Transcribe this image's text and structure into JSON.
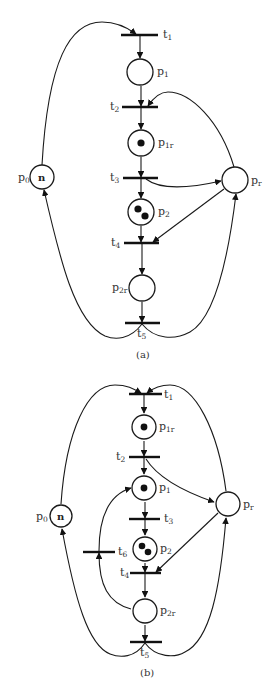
{
  "figure": {
    "type": "petri-net-pair",
    "colors": {
      "stroke": "#1a1a1a",
      "token": "#111111",
      "background": "#ffffff"
    }
  },
  "diagram_a": {
    "caption": "(a)",
    "places": {
      "p0": {
        "base": "p",
        "sub": "0",
        "marking": "n"
      },
      "p1": {
        "base": "p",
        "sub": "1",
        "tokens": 0
      },
      "p1r": {
        "base": "p",
        "sub": "1r",
        "tokens": 1
      },
      "p2": {
        "base": "p",
        "sub": "2",
        "tokens": 2
      },
      "p2r": {
        "base": "p",
        "sub": "2r",
        "tokens": 0
      },
      "pr": {
        "base": "p",
        "sub": "r",
        "tokens": 0
      }
    },
    "transitions": {
      "t1": {
        "base": "t",
        "sub": "1"
      },
      "t2": {
        "base": "t",
        "sub": "2"
      },
      "t3": {
        "base": "t",
        "sub": "3"
      },
      "t4": {
        "base": "t",
        "sub": "4"
      },
      "t5": {
        "base": "t",
        "sub": "5"
      }
    },
    "arcs": [
      [
        "p0",
        "t1"
      ],
      [
        "t1",
        "p1"
      ],
      [
        "p1",
        "t2"
      ],
      [
        "pr",
        "t2"
      ],
      [
        "t2",
        "p1r"
      ],
      [
        "p1r",
        "t3"
      ],
      [
        "t3",
        "p2"
      ],
      [
        "t3",
        "pr"
      ],
      [
        "p2",
        "t4"
      ],
      [
        "pr",
        "t4"
      ],
      [
        "t4",
        "p2r"
      ],
      [
        "p2r",
        "t5"
      ],
      [
        "t5",
        "p0"
      ],
      [
        "t5",
        "pr"
      ]
    ]
  },
  "diagram_b": {
    "caption": "(b)",
    "places": {
      "p0": {
        "base": "p",
        "sub": "0",
        "marking": "n"
      },
      "p1r": {
        "base": "p",
        "sub": "1r",
        "tokens": 1
      },
      "p1": {
        "base": "p",
        "sub": "1",
        "tokens": 1
      },
      "p2": {
        "base": "p",
        "sub": "2",
        "tokens": 2
      },
      "p2r": {
        "base": "p",
        "sub": "2r",
        "tokens": 0
      },
      "pr": {
        "base": "p",
        "sub": "r",
        "tokens": 0
      }
    },
    "transitions": {
      "t1": {
        "base": "t",
        "sub": "1"
      },
      "t2": {
        "base": "t",
        "sub": "2"
      },
      "t3": {
        "base": "t",
        "sub": "3"
      },
      "t4": {
        "base": "t",
        "sub": "4"
      },
      "t5": {
        "base": "t",
        "sub": "5"
      },
      "t6": {
        "base": "t",
        "sub": "6"
      }
    },
    "arcs": [
      [
        "p0",
        "t1"
      ],
      [
        "pr",
        "t1"
      ],
      [
        "t1",
        "p1r"
      ],
      [
        "p1r",
        "t2"
      ],
      [
        "t2",
        "p1"
      ],
      [
        "t2",
        "pr"
      ],
      [
        "p1",
        "t3"
      ],
      [
        "t3",
        "p2"
      ],
      [
        "p2",
        "t4"
      ],
      [
        "pr",
        "t4"
      ],
      [
        "t4",
        "p2r"
      ],
      [
        "p2r",
        "t6"
      ],
      [
        "t6",
        "p1"
      ],
      [
        "p2r",
        "t5"
      ],
      [
        "t5",
        "p0"
      ],
      [
        "t5",
        "pr"
      ]
    ]
  }
}
